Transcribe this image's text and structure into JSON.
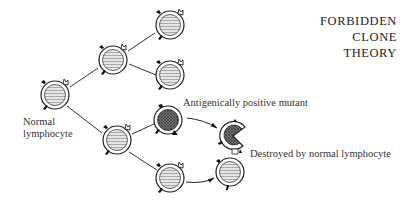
{
  "title": {
    "line1": "FORBIDDEN",
    "line2": "CLONE",
    "line3": "THEORY"
  },
  "labels": {
    "normal_line1": "Normal",
    "normal_line2": "lymphocyte",
    "mutant": "Antigenically positive mutant",
    "destroyed": "Destroyed by normal lymphocyte"
  },
  "cells": [
    {
      "id": "normal-root",
      "type": "normal",
      "cx": 55,
      "cy": 95
    },
    {
      "id": "gen2-upper",
      "type": "normal",
      "cx": 113,
      "cy": 60
    },
    {
      "id": "gen3-top",
      "type": "normal",
      "cx": 170,
      "cy": 25
    },
    {
      "id": "gen3-second",
      "type": "normal",
      "cx": 170,
      "cy": 75
    },
    {
      "id": "gen2-lower",
      "type": "normal",
      "cx": 117,
      "cy": 140
    },
    {
      "id": "mutant",
      "type": "mutant",
      "cx": 168,
      "cy": 120
    },
    {
      "id": "gen3-bottom",
      "type": "normal",
      "cx": 170,
      "cy": 178
    },
    {
      "id": "destroyed-mutant",
      "type": "destroyed",
      "cx": 235,
      "cy": 135
    },
    {
      "id": "attacking-normal",
      "type": "normal",
      "cx": 230,
      "cy": 172
    }
  ],
  "colors": {
    "ink": "#222222",
    "fill": "#dcdcdc",
    "mutant_fill": "#555555"
  }
}
